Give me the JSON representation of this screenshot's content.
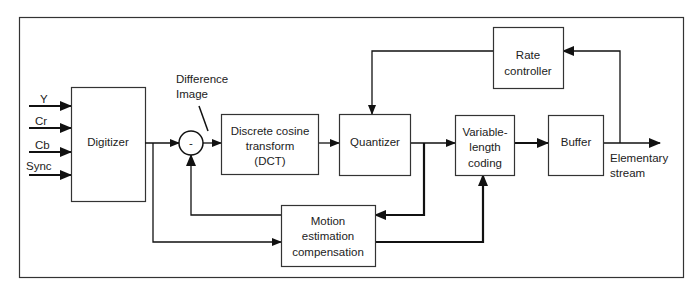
{
  "diagram": {
    "type": "block-diagram",
    "title": "",
    "inputs": [
      {
        "label": "Y"
      },
      {
        "label": "Cr"
      },
      {
        "label": "Cb"
      },
      {
        "label": "Sync"
      }
    ],
    "blocks": {
      "digitizer": {
        "label": "Digitizer"
      },
      "subtractor": {
        "label": "-"
      },
      "dct": {
        "lines": [
          "Discrete cosine",
          "transform",
          "(DCT)"
        ]
      },
      "quantizer": {
        "label": "Quantizer"
      },
      "vlc": {
        "lines": [
          "Variable-",
          "length",
          "coding"
        ]
      },
      "buffer": {
        "label": "Buffer"
      },
      "rate_controller": {
        "lines": [
          "Rate",
          "controller"
        ]
      },
      "motion": {
        "lines": [
          "Motion",
          "estimation",
          "compensation"
        ]
      }
    },
    "annotations": {
      "difference_image": [
        "Difference",
        "Image"
      ],
      "output": [
        "Elementary",
        "stream"
      ]
    },
    "edges": [
      {
        "from": "Y",
        "to": "Digitizer"
      },
      {
        "from": "Cr",
        "to": "Digitizer"
      },
      {
        "from": "Cb",
        "to": "Digitizer"
      },
      {
        "from": "Sync",
        "to": "Digitizer"
      },
      {
        "from": "Digitizer",
        "to": "Subtractor"
      },
      {
        "from": "Digitizer",
        "to": "Motion estimation compensation"
      },
      {
        "from": "Subtractor",
        "to": "Discrete cosine transform (DCT)"
      },
      {
        "from": "Discrete cosine transform (DCT)",
        "to": "Quantizer"
      },
      {
        "from": "Quantizer",
        "to": "Variable-length coding"
      },
      {
        "from": "Quantizer",
        "to": "Motion estimation compensation"
      },
      {
        "from": "Motion estimation compensation",
        "to": "Subtractor"
      },
      {
        "from": "Motion estimation compensation",
        "to": "Variable-length coding"
      },
      {
        "from": "Variable-length coding",
        "to": "Buffer"
      },
      {
        "from": "Buffer",
        "to": "Elementary stream"
      },
      {
        "from": "Buffer",
        "to": "Rate controller"
      },
      {
        "from": "Rate controller",
        "to": "Quantizer"
      }
    ]
  }
}
